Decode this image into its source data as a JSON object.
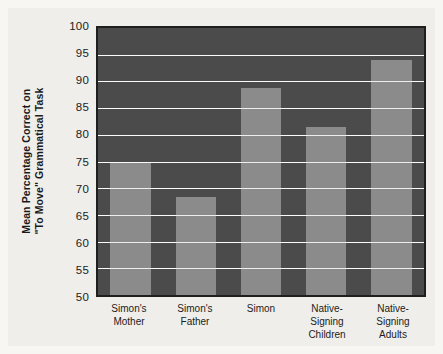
{
  "chart_data": {
    "type": "bar",
    "title": "",
    "subtitle": "",
    "xlabel": "",
    "ylabel": "Mean Percentage Correct on \"To Move\" Grammatical Task",
    "ylabel_lines": [
      "Mean Percentage Correct on",
      "\"To Move\" Grammatical Task"
    ],
    "categories": [
      "Simon's Mother",
      "Simon's Father",
      "Simon",
      "Native-Signing Children",
      "Native-Signing Adults"
    ],
    "category_lines": [
      [
        "Simon's",
        "Mother"
      ],
      [
        "Simon's",
        "Father"
      ],
      [
        "Simon"
      ],
      [
        "Native-Signing",
        "Children"
      ],
      [
        "Native-Signing",
        "Adults"
      ]
    ],
    "values": [
      74.8,
      68.3,
      88.8,
      81.5,
      94.1
    ],
    "ylim": [
      50,
      100
    ],
    "yticks": [
      100,
      95,
      90,
      85,
      80,
      75,
      70,
      65,
      60,
      55,
      50
    ],
    "ytick_labels": [
      "100",
      "95",
      "90",
      "85",
      "80",
      "75",
      "70",
      "65",
      "60",
      "55",
      "50"
    ],
    "grid": true,
    "grid_color": "#ffffff",
    "legend": false,
    "legend_entries": [],
    "annotations": [],
    "bar_color": "#8b8b8b",
    "plot_background": "#4b4b4b",
    "figure_background": "#efeeea",
    "axis_color": "#1f1f1f"
  }
}
